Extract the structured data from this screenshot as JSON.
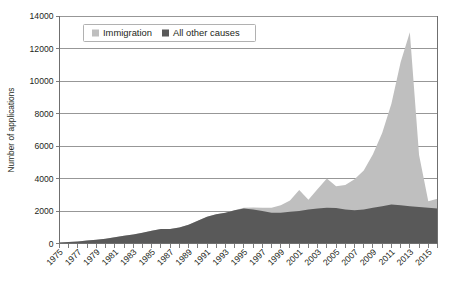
{
  "chart_data": {
    "type": "area",
    "title": "",
    "subtitle": "",
    "xlabel": "",
    "ylabel": "Number of applications",
    "stacked": true,
    "grid": true,
    "legend_position": "top-left-inside",
    "xlim": [
      1975,
      2016
    ],
    "ylim": [
      0,
      14000
    ],
    "yticks": [
      0,
      2000,
      4000,
      6000,
      8000,
      10000,
      12000,
      14000
    ],
    "ytick_labels": [
      "0",
      "2000",
      "4000",
      "6000",
      "8000",
      "10000",
      "12000",
      "14000"
    ],
    "xticks": [
      1975,
      1977,
      1979,
      1981,
      1983,
      1985,
      1987,
      1989,
      1991,
      1993,
      1995,
      1997,
      1999,
      2001,
      2003,
      2005,
      2007,
      2009,
      2011,
      2013,
      2015
    ],
    "xtick_labels": [
      "1975",
      "1977",
      "1979",
      "1981",
      "1983",
      "1985",
      "1987",
      "1989",
      "1991",
      "1993",
      "1995",
      "1997",
      "1999",
      "2001",
      "2003",
      "2005",
      "2007",
      "2009",
      "2011",
      "2013",
      "2015"
    ],
    "x": [
      1975,
      1976,
      1977,
      1978,
      1979,
      1980,
      1981,
      1982,
      1983,
      1984,
      1985,
      1986,
      1987,
      1988,
      1989,
      1990,
      1991,
      1992,
      1993,
      1994,
      1995,
      1996,
      1997,
      1998,
      1999,
      2000,
      2001,
      2002,
      2003,
      2004,
      2005,
      2006,
      2007,
      2008,
      2009,
      2010,
      2011,
      2012,
      2013,
      2014,
      2015,
      2016
    ],
    "series": [
      {
        "name": "All other causes",
        "color": "#595959",
        "values": [
          60,
          90,
          130,
          180,
          230,
          300,
          380,
          470,
          560,
          660,
          780,
          900,
          900,
          980,
          1150,
          1400,
          1650,
          1800,
          1900,
          2050,
          2150,
          2100,
          2000,
          1900,
          1900,
          1950,
          2000,
          2100,
          2150,
          2200,
          2180,
          2100,
          2050,
          2100,
          2200,
          2300,
          2400,
          2350,
          2300,
          2250,
          2200,
          2150
        ]
      },
      {
        "name": "Immigration",
        "color": "#bfbfbf",
        "values": [
          0,
          0,
          0,
          0,
          0,
          0,
          0,
          0,
          0,
          0,
          0,
          0,
          0,
          0,
          0,
          0,
          0,
          0,
          0,
          0,
          50,
          120,
          200,
          300,
          450,
          700,
          1300,
          600,
          1200,
          1800,
          1350,
          1500,
          1900,
          2400,
          3300,
          4500,
          6200,
          8800,
          10700,
          3200,
          400,
          600
        ]
      }
    ],
    "legend": [
      {
        "label": "Immigration",
        "color": "#bfbfbf"
      },
      {
        "label": "All other causes",
        "color": "#595959"
      }
    ],
    "notes": {
      "peak_year": 2013,
      "peak_total": 13000,
      "immigration_share_note": "Immigration applications surge sharply from 2009 to a 2013 peak then collapse."
    }
  },
  "colors": {
    "immigration": "#bfbfbf",
    "all_other_causes": "#595959",
    "gridline": "#8c8c8c",
    "axis": "#6f6f6f",
    "text": "#231f20",
    "background": "#ffffff"
  }
}
